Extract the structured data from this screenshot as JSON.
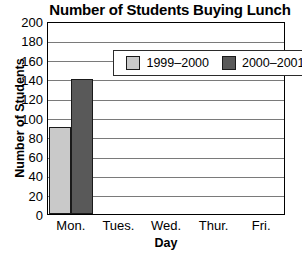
{
  "chart_data": {
    "type": "bar",
    "title": "Number of Students Buying Lunch",
    "xlabel": "Day",
    "ylabel": "Number of Students",
    "categories": [
      "Mon.",
      "Tues.",
      "Wed.",
      "Thur.",
      "Fri."
    ],
    "series": [
      {
        "name": "1999–2000",
        "color": "#c9c9c9",
        "values": [
          90,
          0,
          0,
          0,
          0
        ]
      },
      {
        "name": "2000–2001",
        "color": "#595959",
        "values": [
          140,
          0,
          0,
          0,
          0
        ]
      }
    ],
    "ylim": [
      0,
      200
    ],
    "ytick_step": 20,
    "yticks": [
      200,
      180,
      160,
      140,
      120,
      100,
      80,
      60,
      40,
      20,
      0
    ],
    "grid": "horizontal",
    "legend_position": "top-inside",
    "axis_color": "#000000",
    "gridline_color": "#7a7a7a",
    "bar_edge_color": "#1a1a1a"
  }
}
